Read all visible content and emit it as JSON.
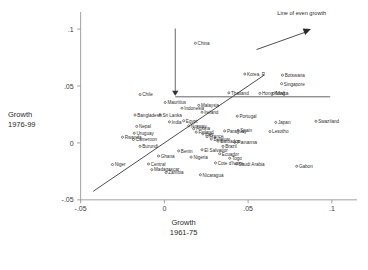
{
  "chart_data": {
    "type": "scatter",
    "title": "",
    "xlabel": "Growth 1961-75",
    "ylabel": "Growth 1976-99",
    "xlabel_line1": "Growth",
    "xlabel_line2": "1961-75",
    "ylabel_line1": "Growth",
    "ylabel_line2": "1976-99",
    "xlim": [
      -0.065,
      0.115
    ],
    "ylim": [
      -0.062,
      0.115
    ],
    "xticks": [
      -0.05,
      0,
      0.05,
      0.1
    ],
    "xticklabels": [
      "-.05",
      "0",
      ".05",
      ".1"
    ],
    "yticks": [
      -0.05,
      0,
      0.05,
      0.1
    ],
    "yticklabels": [
      "-.05",
      "0",
      ".05",
      ".1"
    ],
    "grid": false,
    "legend_position": "none",
    "annotations": [
      {
        "name": "line-of-even-growth",
        "text": "Line of even growth",
        "x": 0.082,
        "y": 0.112
      },
      {
        "name": "even-growth-arrow",
        "type": "arrow",
        "x1": 0.055,
        "y1": 0.082,
        "x2": 0.0875,
        "y2": 0.1
      },
      {
        "name": "mauritius-pointer",
        "type": "vline-arrow",
        "x": 0.0065,
        "y_top": 0.1005,
        "y_bottom": 0.0415
      },
      {
        "name": "reference-hline",
        "type": "hline",
        "x1": 0.0065,
        "x2": 0.099,
        "y": 0.0405
      }
    ],
    "diagonal_line": {
      "name": "45-degree-line",
      "x1": -0.0425,
      "y1": -0.0425,
      "x2": 0.0595,
      "y2": 0.0595
    },
    "points": [
      {
        "label": "China",
        "x": 0.0185,
        "y": 0.0875,
        "align": "left",
        "size": "normal"
      },
      {
        "label": "Korea, R",
        "x": 0.048,
        "y": 0.0605,
        "align": "left",
        "size": "normal"
      },
      {
        "label": "Botswana",
        "x": 0.0705,
        "y": 0.0595,
        "align": "left",
        "size": "normal"
      },
      {
        "label": "Singapore",
        "x": 0.07,
        "y": 0.052,
        "align": "left",
        "size": "normal"
      },
      {
        "label": "Thailand",
        "x": 0.0385,
        "y": 0.044,
        "align": "left",
        "size": "normal"
      },
      {
        "label": "Hong Kong",
        "x": 0.057,
        "y": 0.0435,
        "align": "left",
        "size": "normal"
      },
      {
        "label": "Malta",
        "x": 0.065,
        "y": 0.0435,
        "align": "left",
        "size": "big"
      },
      {
        "label": "Mauritius",
        "x": 0.0005,
        "y": 0.0355,
        "align": "left",
        "size": "normal"
      },
      {
        "label": "Malaysia",
        "x": 0.0205,
        "y": 0.033,
        "align": "left",
        "size": "normal"
      },
      {
        "label": "Indonesia",
        "x": 0.0105,
        "y": 0.0305,
        "align": "left",
        "size": "normal"
      },
      {
        "label": "Ireland",
        "x": 0.0225,
        "y": 0.027,
        "align": "left",
        "size": "normal"
      },
      {
        "label": "Chile",
        "x": -0.0145,
        "y": 0.0425,
        "align": "left",
        "size": "normal"
      },
      {
        "label": "Sri Lanka",
        "x": -0.0025,
        "y": 0.0245,
        "align": "left",
        "size": "normal"
      },
      {
        "label": "Bangladesh",
        "x": -0.0175,
        "y": 0.0245,
        "align": "left",
        "size": "normal"
      },
      {
        "label": "Portugal",
        "x": 0.0435,
        "y": 0.0235,
        "align": "left",
        "size": "normal"
      },
      {
        "label": "Japan",
        "x": 0.0665,
        "y": 0.018,
        "align": "left",
        "size": "normal"
      },
      {
        "label": "Spain",
        "x": 0.044,
        "y": 0.011,
        "align": "left",
        "size": "normal"
      },
      {
        "label": "Lesotho",
        "x": 0.063,
        "y": 0.01,
        "align": "left",
        "size": "normal"
      },
      {
        "label": "Nepal",
        "x": -0.0165,
        "y": 0.0145,
        "align": "left",
        "size": "normal"
      },
      {
        "label": "Uruguay",
        "x": -0.018,
        "y": 0.0085,
        "align": "left",
        "size": "normal"
      },
      {
        "label": "Cameroon",
        "x": -0.0185,
        "y": 0.003,
        "align": "left",
        "size": "normal"
      },
      {
        "label": "Rwanda",
        "x": -0.025,
        "y": 0.005,
        "align": "left",
        "size": "normal"
      },
      {
        "label": "Burundi",
        "x": -0.0145,
        "y": -0.003,
        "align": "left",
        "size": "normal"
      },
      {
        "label": "India",
        "x": 0.003,
        "y": 0.0185,
        "align": "left",
        "size": "normal"
      },
      {
        "label": "Egypt",
        "x": 0.0115,
        "y": 0.0195,
        "align": "left",
        "size": "normal"
      },
      {
        "label": "Norway",
        "x": 0.0145,
        "y": 0.015,
        "align": "left",
        "size": "normal"
      },
      {
        "label": "Austria",
        "x": 0.0175,
        "y": 0.0125,
        "align": "left",
        "size": "normal"
      },
      {
        "label": "Finland",
        "x": 0.019,
        "y": 0.0095,
        "align": "left",
        "size": "normal"
      },
      {
        "label": "Italy",
        "x": 0.023,
        "y": 0.008,
        "align": "left",
        "size": "normal"
      },
      {
        "label": "France",
        "x": 0.0255,
        "y": 0.0055,
        "align": "left",
        "size": "normal"
      },
      {
        "label": "Belgium",
        "x": 0.028,
        "y": 0.0035,
        "align": "left",
        "size": "normal"
      },
      {
        "label": "Barbados",
        "x": 0.032,
        "y": 0.0015,
        "align": "left",
        "size": "normal"
      },
      {
        "label": "Paraguay",
        "x": 0.036,
        "y": 0.0105,
        "align": "left",
        "size": "normal"
      },
      {
        "label": "Panama",
        "x": 0.042,
        "y": 0.0005,
        "align": "left",
        "size": "big"
      },
      {
        "label": "Brazil",
        "x": 0.035,
        "y": -0.003,
        "align": "left",
        "size": "normal"
      },
      {
        "label": "Ecuador",
        "x": 0.033,
        "y": -0.0095,
        "align": "left",
        "size": "normal"
      },
      {
        "label": "El Salvador",
        "x": 0.0225,
        "y": -0.006,
        "align": "left",
        "size": "normal"
      },
      {
        "label": "Nigeria",
        "x": 0.016,
        "y": -0.0125,
        "align": "left",
        "size": "normal"
      },
      {
        "label": "Benin",
        "x": 0.0085,
        "y": -0.007,
        "align": "left",
        "size": "normal"
      },
      {
        "label": "Togo",
        "x": 0.039,
        "y": -0.0135,
        "align": "left",
        "size": "normal"
      },
      {
        "label": "Cote d'Ivoire",
        "x": 0.0305,
        "y": -0.0175,
        "align": "left",
        "size": "normal"
      },
      {
        "label": "Saudi Arabia",
        "x": 0.043,
        "y": -0.0185,
        "align": "left",
        "size": "normal"
      },
      {
        "label": "Gabon",
        "x": 0.079,
        "y": -0.0205,
        "align": "left",
        "size": "normal"
      },
      {
        "label": "Swaziland",
        "x": 0.0905,
        "y": 0.019,
        "align": "left",
        "size": "normal"
      },
      {
        "label": "Nicaragua",
        "x": 0.0215,
        "y": -0.028,
        "align": "left",
        "size": "normal"
      },
      {
        "label": "Zambia",
        "x": 0.001,
        "y": -0.026,
        "align": "left",
        "size": "normal"
      },
      {
        "label": "Madagascar",
        "x": -0.0075,
        "y": -0.0235,
        "align": "left",
        "size": "normal"
      },
      {
        "label": "Central",
        "x": -0.0095,
        "y": -0.0185,
        "align": "left",
        "size": "normal"
      },
      {
        "label": "Ghana",
        "x": -0.0035,
        "y": -0.0115,
        "align": "left",
        "size": "normal"
      },
      {
        "label": "Niger",
        "x": -0.031,
        "y": -0.019,
        "align": "left",
        "size": "normal"
      }
    ]
  },
  "colors": {
    "axis": "#8a8a8a",
    "text": "#2f2f2f",
    "line": "#3a3a3a",
    "background": "#ffffff"
  }
}
